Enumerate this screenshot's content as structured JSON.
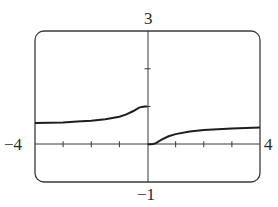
{
  "labels": {
    "ymax": "3",
    "ymin": "−1",
    "xmin": "−4",
    "xmax": "4"
  },
  "chart_data": {
    "type": "line",
    "title": "",
    "xlabel": "",
    "ylabel": "",
    "xlim": [
      -4,
      4
    ],
    "ylim": [
      -1,
      3
    ],
    "grid": false,
    "legend": null,
    "x_ticks": [
      -3,
      -2,
      -1,
      1,
      2,
      3
    ],
    "y_ticks": [
      1,
      2
    ],
    "annotations": [
      "window: [-4, 4] by [-1, 3]"
    ],
    "series": [
      {
        "name": "left branch (x<0)",
        "x": [
          -4,
          -3.5,
          -3,
          -2.5,
          -2,
          -1.5,
          -1,
          -0.75,
          -0.5,
          -0.3,
          -0.2,
          -0.1,
          -0.01
        ],
        "y": [
          0.56,
          0.57,
          0.58,
          0.6,
          0.62,
          0.66,
          0.73,
          0.79,
          0.88,
          0.97,
          0.99,
          1.0,
          1.0
        ]
      },
      {
        "name": "right branch (x>0)",
        "x": [
          0.01,
          0.1,
          0.2,
          0.3,
          0.5,
          0.75,
          1,
          1.5,
          2,
          2.5,
          3,
          3.5,
          4
        ],
        "y": [
          0.0,
          0.0,
          0.01,
          0.03,
          0.12,
          0.21,
          0.27,
          0.34,
          0.38,
          0.4,
          0.42,
          0.43,
          0.44
        ]
      }
    ]
  }
}
